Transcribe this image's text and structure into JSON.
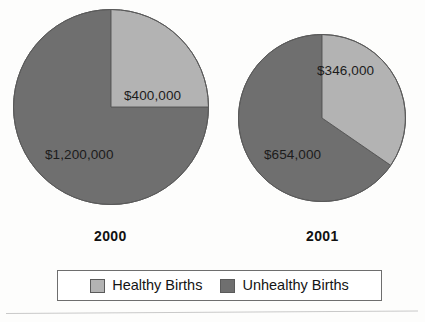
{
  "chart_data": {
    "type": "pie",
    "title": "",
    "charts": [
      {
        "caption": "2000",
        "labels": [
          "Healthy Births",
          "Unhealthy Births"
        ],
        "values": [
          400000,
          1200000
        ],
        "value_labels": [
          "$400,000",
          "$1,200,000"
        ],
        "percentages": [
          25,
          75
        ],
        "start_angle_deg": 0,
        "center": [
          111,
          107
        ],
        "radius": 98
      },
      {
        "caption": "2001",
        "labels": [
          "Healthy Births",
          "Unhealthy Births"
        ],
        "values": [
          346000,
          654000
        ],
        "value_labels": [
          "$346,000",
          "$654,000"
        ],
        "percentages": [
          34.6,
          65.4
        ],
        "start_angle_deg": 0,
        "center": [
          322,
          118
        ],
        "radius": 84
      }
    ],
    "legend": {
      "position": "bottom",
      "entries": [
        {
          "label": "Healthy Births",
          "color": "#b3b3b3"
        },
        {
          "label": "Unhealthy Births",
          "color": "#6f6f6f"
        }
      ]
    },
    "colors": {
      "healthy": "#b3b3b3",
      "unhealthy": "#6f6f6f",
      "outline": "#5a5a5a",
      "text": "#141414",
      "background": "#fdfdfc"
    },
    "grid": false
  },
  "charts": {
    "chart_2000": {
      "caption": "2000",
      "healthy_value_label": "$400,000",
      "unhealthy_value_label": "$1,200,000"
    },
    "chart_2001": {
      "caption": "2001",
      "healthy_value_label": "$346,000",
      "unhealthy_value_label": "$654,000"
    }
  },
  "legend": {
    "healthy_label": "Healthy Births",
    "unhealthy_label": "Unhealthy Births"
  }
}
